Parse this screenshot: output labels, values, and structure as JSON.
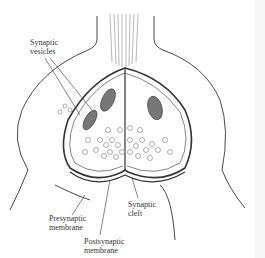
{
  "diagram": {
    "labels": {
      "synaptic_vesicles": {
        "line1": "Synaptic",
        "line2": "vesicles"
      },
      "presynaptic_membrane": {
        "line1": "Presynaptic",
        "line2": "membrane"
      },
      "postsynaptic_membrane": {
        "line1": "Postsynaptic",
        "line2": "membrane"
      },
      "synaptic_cleft": {
        "line1": "Synaptic",
        "line2": "cleft"
      }
    },
    "colors": {
      "ink": "#333333",
      "background": "#ffffff",
      "vesicle": "#777777"
    }
  }
}
